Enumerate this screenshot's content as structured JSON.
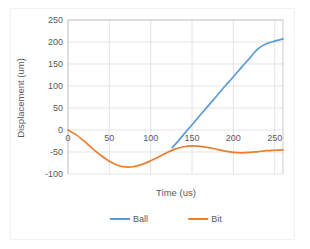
{
  "chart_data": {
    "type": "line",
    "title": "",
    "xlabel": "Time (us)",
    "ylabel": "Displacement (um)",
    "xlim": [
      0,
      260
    ],
    "ylim": [
      -100,
      250
    ],
    "xticks": [
      0,
      50,
      100,
      150,
      200,
      250
    ],
    "yticks": [
      -100,
      -50,
      0,
      50,
      100,
      150,
      200,
      250
    ],
    "grid": true,
    "legend_position": "bottom",
    "series": [
      {
        "name": "Ball",
        "color": "#5B9BD5",
        "x": [
          126,
          130,
          140,
          150,
          160,
          170,
          180,
          190,
          200,
          210,
          220,
          230,
          240,
          250,
          260
        ],
        "values": [
          -40,
          -32,
          -10,
          12,
          34,
          56,
          78,
          100,
          121,
          143,
          164,
          185,
          196,
          202,
          207
        ]
      },
      {
        "name": "Bit",
        "color": "#ED7D31",
        "x": [
          0,
          10,
          20,
          30,
          40,
          50,
          60,
          70,
          80,
          90,
          100,
          110,
          120,
          130,
          140,
          150,
          160,
          170,
          180,
          190,
          200,
          210,
          220,
          230,
          240,
          250,
          260
        ],
        "values": [
          0,
          -11,
          -26,
          -43,
          -58,
          -71,
          -80,
          -84,
          -83,
          -78,
          -70,
          -61,
          -51,
          -43,
          -38,
          -36,
          -37,
          -40,
          -44,
          -48,
          -51,
          -52,
          -51,
          -49,
          -47,
          -46,
          -45
        ]
      }
    ]
  },
  "axis": {
    "y_tick_labels": [
      "250",
      "200",
      "150",
      "100",
      "50",
      "0",
      "-50",
      "-100"
    ],
    "x_tick_labels": [
      "0",
      "50",
      "100",
      "150",
      "200",
      "250"
    ],
    "x_title": "Time (us)",
    "y_title": "Displacement (um)"
  },
  "legend": {
    "entries": [
      {
        "label": "Ball",
        "color": "#5B9BD5"
      },
      {
        "label": "Bit",
        "color": "#ED7D31"
      }
    ]
  },
  "colors": {
    "series_ball": "#5B9BD5",
    "series_bit": "#ED7D31",
    "gridline": "#D9D9D9",
    "axis": "#BFBFBF",
    "text": "#595959",
    "plot_background": "#FFFFFF",
    "frame_border": "#F2F2F2"
  }
}
